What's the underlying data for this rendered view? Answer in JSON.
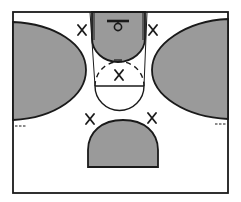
{
  "diagram": {
    "type": "basketball-half-court",
    "colors": {
      "shaded_zone": "#9a9a9a",
      "line": "#1a1a1a",
      "background": "#ffffff"
    },
    "zones": [
      {
        "id": "left-wing",
        "shaded": true
      },
      {
        "id": "right-wing",
        "shaded": true
      },
      {
        "id": "key-lane",
        "shaded": true
      },
      {
        "id": "top-of-key",
        "shaded": true
      }
    ],
    "players": [
      {
        "id": "p1",
        "mark": "X",
        "x": 82,
        "y": 30
      },
      {
        "id": "p2",
        "mark": "X",
        "x": 153,
        "y": 30
      },
      {
        "id": "p3",
        "mark": "X",
        "x": 119,
        "y": 75
      },
      {
        "id": "p4",
        "mark": "X",
        "x": 90,
        "y": 119
      },
      {
        "id": "p5",
        "mark": "X",
        "x": 152,
        "y": 118
      }
    ]
  }
}
